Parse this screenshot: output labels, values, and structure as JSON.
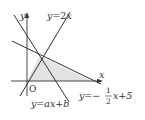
{
  "diagram": {
    "type": "coordinate-graph",
    "colors": {
      "line": "#333333",
      "shade": "#e2e2e2",
      "background": "#ffffff"
    },
    "axes": {
      "x_label": "x",
      "y_label": "y",
      "origin_label": "O"
    },
    "lines": [
      {
        "id": "line-2x",
        "equation": "y=2x",
        "label_lhs": "y",
        "label_eq": "=2",
        "label_var": "x"
      },
      {
        "id": "line-axb",
        "equation": "y=ax+b",
        "label": "y=ax+b"
      },
      {
        "id": "line-half",
        "equation": "y=-1/2x+5",
        "label_lhs": "y=−",
        "frac_num": "1",
        "frac_den": "2",
        "label_rhs": "x+5"
      }
    ],
    "shaded_region": "triangle bounded by y=2x, y=-1/2x+5 and the x-axis"
  }
}
